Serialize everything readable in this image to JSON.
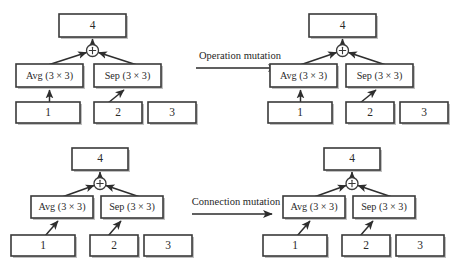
{
  "figure": {
    "background_color": "#ffffff",
    "box_stroke_color": "#3a3a3a",
    "edge_color": "#2e2e2e",
    "text_color": "#2a2a2a"
  },
  "labels": {
    "operation_mutation": "Operation mutation",
    "connection_mutation": "Connection mutation",
    "sum_node": "+",
    "output_node": "4",
    "input_1": "1",
    "input_2": "2",
    "input_3": "3",
    "op_avg": "Avg (3 × 3)",
    "op_sep": "Sep (3 × 3)"
  },
  "panels": [
    {
      "id": "top-left",
      "role": "before",
      "mutation": "Operation mutation",
      "output": "4",
      "sum": "+",
      "operations": [
        "Avg (3 × 3)",
        "Sep (3 × 3)"
      ],
      "inputs": [
        "1",
        "2",
        "3"
      ],
      "connections": [
        {
          "from": "1",
          "to": "Avg (3 × 3)",
          "style": "vertical"
        },
        {
          "from": "2",
          "to": "Sep (3 × 3)",
          "style": "diagonal"
        },
        {
          "from": "Avg (3 × 3)",
          "to": "+",
          "style": "diagonal"
        },
        {
          "from": "Sep (3 × 3)",
          "to": "+",
          "style": "diagonal"
        },
        {
          "from": "+",
          "to": "4",
          "style": "vertical"
        }
      ]
    },
    {
      "id": "top-right",
      "role": "after",
      "mutation": "Operation mutation",
      "output": "4",
      "sum": "+",
      "operations": [
        "Avg (3 × 3)",
        "Sep (3 × 3)"
      ],
      "inputs": [
        "1",
        "2",
        "3"
      ],
      "connections": [
        {
          "from": "1",
          "to": "Avg (3 × 3)",
          "style": "vertical"
        },
        {
          "from": "2",
          "to": "Sep (3 × 3)",
          "style": "diagonal"
        },
        {
          "from": "Avg (3 × 3)",
          "to": "+",
          "style": "diagonal"
        },
        {
          "from": "Sep (3 × 3)",
          "to": "+",
          "style": "diagonal"
        },
        {
          "from": "+",
          "to": "4",
          "style": "vertical"
        }
      ]
    },
    {
      "id": "bottom-left",
      "role": "before",
      "mutation": "Connection mutation",
      "output": "4",
      "sum": "+",
      "operations": [
        "Avg (3 × 3)",
        "Sep (3 × 3)"
      ],
      "inputs": [
        "1",
        "2",
        "3"
      ],
      "connections": [
        {
          "from": "1",
          "to": "Avg (3 × 3)",
          "style": "diagonal"
        },
        {
          "from": "2",
          "to": "Sep (3 × 3)",
          "style": "diagonal"
        },
        {
          "from": "Avg (3 × 3)",
          "to": "+",
          "style": "diagonal"
        },
        {
          "from": "Sep (3 × 3)",
          "to": "+",
          "style": "diagonal"
        },
        {
          "from": "+",
          "to": "4",
          "style": "vertical"
        }
      ]
    },
    {
      "id": "bottom-right",
      "role": "after",
      "mutation": "Connection mutation",
      "output": "4",
      "sum": "+",
      "operations": [
        "Avg (3 × 3)",
        "Sep (3 × 3)"
      ],
      "inputs": [
        "1",
        "2",
        "3"
      ],
      "connections": [
        {
          "from": "1",
          "to": "Avg (3 × 3)",
          "style": "diagonal"
        },
        {
          "from": "2",
          "to": "Sep (3 × 3)",
          "style": "diagonal"
        },
        {
          "from": "Avg (3 × 3)",
          "to": "+",
          "style": "diagonal"
        },
        {
          "from": "Sep (3 × 3)",
          "to": "+",
          "style": "diagonal"
        },
        {
          "from": "+",
          "to": "4",
          "style": "vertical"
        }
      ]
    }
  ]
}
